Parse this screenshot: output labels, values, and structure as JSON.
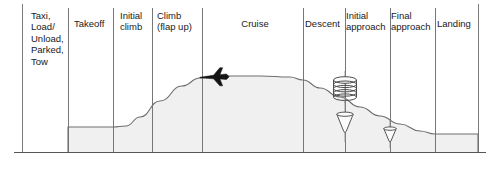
{
  "figure": {
    "colors": {
      "region_fill": "#f0f0f0",
      "profile_line": "#6e6e6e",
      "divider_line": "#777777",
      "ground_line": "#555555",
      "frame_line": "#7a7a7a",
      "text": "#1a1a1a",
      "aircraft_silhouette": "#1a1a1a"
    },
    "phases": [
      {
        "id": "taxi",
        "label": "Taxi,\nLoad/\nUnload,\nParked,\nTow",
        "align": "left",
        "x": 31,
        "y": 10,
        "width": 40
      },
      {
        "id": "takeoff",
        "label": "Takeoff",
        "align": "left",
        "x": 74,
        "y": 18,
        "width": 44
      },
      {
        "id": "initial-climb",
        "label": "Initial\nclimb",
        "align": "left",
        "x": 120,
        "y": 10,
        "width": 36
      },
      {
        "id": "climb-flap-up",
        "label": "Climb\n(flap up)",
        "align": "left",
        "x": 157,
        "y": 10,
        "width": 50
      },
      {
        "id": "cruise",
        "label": "Cruise",
        "align": "center",
        "x": 210,
        "y": 18,
        "width": 90
      },
      {
        "id": "descent",
        "label": "Descent",
        "align": "left",
        "x": 305,
        "y": 18,
        "width": 42
      },
      {
        "id": "initial-approach",
        "label": "Initial\napproach",
        "align": "left",
        "x": 346,
        "y": 10,
        "width": 48
      },
      {
        "id": "final-approach",
        "label": "Final\napproach",
        "align": "left",
        "x": 391,
        "y": 10,
        "width": 48
      },
      {
        "id": "landing",
        "label": "Landing",
        "align": "left",
        "x": 437,
        "y": 18,
        "width": 42
      }
    ],
    "symbols": [
      {
        "id": "cruise-aircraft",
        "name": "airplane-icon",
        "x": 213,
        "y": 77
      },
      {
        "id": "holding-stack",
        "name": "holding-pattern-icon",
        "x": 345,
        "y": 97,
        "rings": 5
      },
      {
        "id": "initial-app-cone",
        "name": "approach-cone-icon",
        "x": 345,
        "y": 116
      },
      {
        "id": "final-app-cone",
        "name": "approach-cone-icon",
        "x": 390,
        "y": 130
      }
    ]
  },
  "chart_data": {
    "type": "area",
    "xlabel": "",
    "ylabel": "Altitude",
    "grid": false,
    "legend": "none",
    "x_axis_type": "categorical phases",
    "categories": [
      "Taxi, Load/Unload, Parked, Tow",
      "Takeoff",
      "Initial climb",
      "Climb (flap up)",
      "Cruise",
      "Descent",
      "Initial approach",
      "Final approach",
      "Landing"
    ],
    "phase_boundaries_px": [
      22,
      68,
      113,
      152,
      202,
      303,
      345,
      390,
      435,
      478
    ],
    "ground_level_px": 152,
    "profile_points_px": [
      {
        "x": 68,
        "y": 152
      },
      {
        "x": 68,
        "y": 127
      },
      {
        "x": 113,
        "y": 127
      },
      {
        "x": 126,
        "y": 126
      },
      {
        "x": 140,
        "y": 117
      },
      {
        "x": 160,
        "y": 101
      },
      {
        "x": 182,
        "y": 86
      },
      {
        "x": 200,
        "y": 78
      },
      {
        "x": 215,
        "y": 76
      },
      {
        "x": 260,
        "y": 76
      },
      {
        "x": 290,
        "y": 77
      },
      {
        "x": 303,
        "y": 80
      },
      {
        "x": 320,
        "y": 88
      },
      {
        "x": 340,
        "y": 97
      },
      {
        "x": 360,
        "y": 107
      },
      {
        "x": 380,
        "y": 116
      },
      {
        "x": 400,
        "y": 124
      },
      {
        "x": 420,
        "y": 131
      },
      {
        "x": 435,
        "y": 134
      },
      {
        "x": 478,
        "y": 134
      },
      {
        "x": 478,
        "y": 152
      }
    ],
    "series": [
      {
        "name": "Relative altitude",
        "values": [
          0,
          0.33,
          0.33,
          0.66,
          1.0,
          0.72,
          0.42,
          0.18,
          0.06
        ]
      }
    ],
    "annotations": [
      {
        "text": "aircraft in cruise",
        "at_phase": "Cruise"
      },
      {
        "text": "holding stack",
        "at_phase": "Initial approach"
      },
      {
        "text": "approach cone",
        "at_phase": "Initial approach"
      },
      {
        "text": "approach cone",
        "at_phase": "Final approach"
      }
    ]
  }
}
